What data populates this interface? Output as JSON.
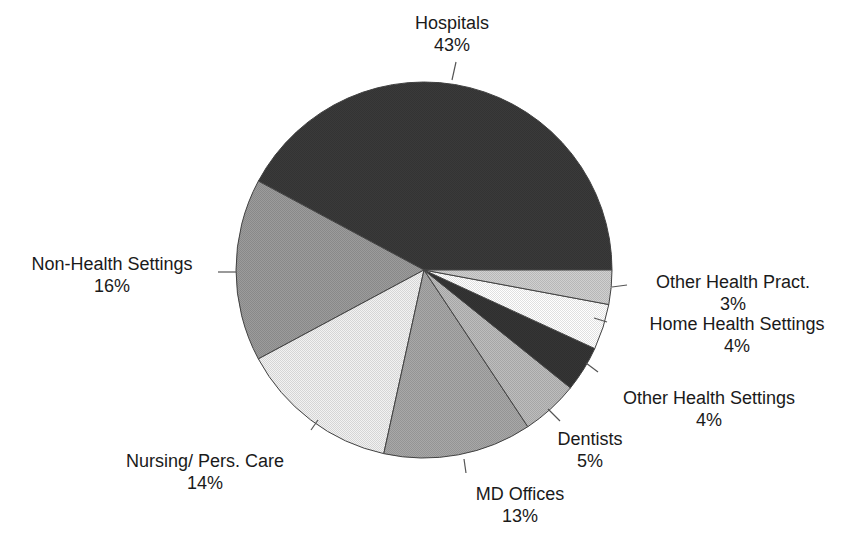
{
  "chart_data": {
    "type": "pie",
    "title": "",
    "start_angle_deg": 0,
    "direction": "counterclockwise",
    "center": [
      424,
      270
    ],
    "radius": 188,
    "slices": [
      {
        "label": "Hospitals",
        "value": 43,
        "pct_label": "43%",
        "fill": "#3a3a3a"
      },
      {
        "label": "Non-Health Settings",
        "value": 16,
        "pct_label": "16%",
        "fill": "#9c9c9c"
      },
      {
        "label": "Nursing/ Pers. Care",
        "value": 14,
        "pct_label": "14%",
        "fill": "#f2f2f2"
      },
      {
        "label": "MD Offices",
        "value": 13,
        "pct_label": "13%",
        "fill": "#a8a8a8"
      },
      {
        "label": "Dentists",
        "value": 5,
        "pct_label": "5%",
        "fill": "#bdbdbd"
      },
      {
        "label": "Other Health Settings",
        "value": 4,
        "pct_label": "4%",
        "fill": "#353535"
      },
      {
        "label": "Home Health Settings",
        "value": 4,
        "pct_label": "4%",
        "fill": "#ffffff"
      },
      {
        "label": "Other Health Pract.",
        "value": 3,
        "pct_label": "3%",
        "fill": "#d0d0d0"
      }
    ],
    "label_positions": [
      {
        "x": 452,
        "y": 12
      },
      {
        "x": 112,
        "y": 253
      },
      {
        "x": 205,
        "y": 450
      },
      {
        "x": 520,
        "y": 483
      },
      {
        "x": 590,
        "y": 428
      },
      {
        "x": 709,
        "y": 387
      },
      {
        "x": 737,
        "y": 313
      },
      {
        "x": 733,
        "y": 271
      }
    ],
    "leader_lines": [
      [
        [
          456,
          62
        ],
        [
          452,
          80
        ]
      ],
      [
        [
          218,
          272
        ],
        [
          236,
          272
        ]
      ],
      [
        [
          311,
          430
        ],
        [
          318,
          420
        ]
      ],
      [
        [
          464,
          459
        ],
        [
          466,
          473
        ]
      ],
      [
        [
          560,
          421
        ],
        [
          548,
          409
        ]
      ],
      [
        [
          598,
          372
        ],
        [
          586,
          363
        ]
      ],
      [
        [
          607,
          322
        ],
        [
          594,
          318
        ]
      ],
      [
        [
          627,
          285
        ],
        [
          612,
          287
        ]
      ]
    ],
    "legend": null,
    "grid": false
  }
}
